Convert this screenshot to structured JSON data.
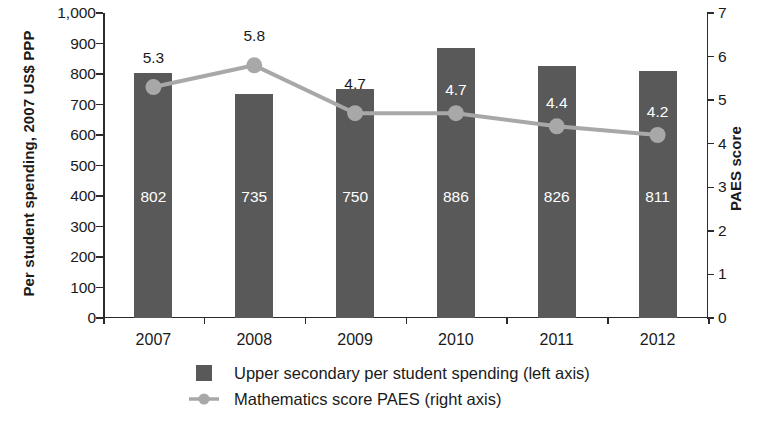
{
  "chart_data": {
    "type": "bar",
    "title": "",
    "subtitle": "",
    "categories": [
      "2007",
      "2008",
      "2009",
      "2010",
      "2011",
      "2012"
    ],
    "xlabel": "",
    "ylabel": "Per student spending, 2007 US$ PPP",
    "ylabel_right": "PAES score",
    "ylim": [
      0,
      1000
    ],
    "ylim_right": [
      0,
      7
    ],
    "yticks": [
      "0",
      "100",
      "200",
      "300",
      "400",
      "500",
      "600",
      "700",
      "800",
      "900",
      "1,000"
    ],
    "ytick_values": [
      0,
      100,
      200,
      300,
      400,
      500,
      600,
      700,
      800,
      900,
      1000
    ],
    "yticks_right": [
      "0",
      "1",
      "2",
      "3",
      "4",
      "5",
      "6",
      "7"
    ],
    "ytick_values_right": [
      0,
      1,
      2,
      3,
      4,
      5,
      6,
      7
    ],
    "grid": false,
    "legend_position": "bottom",
    "series": [
      {
        "name": "Upper secondary per student spending (left axis)",
        "type": "bar",
        "axis": "left",
        "color": "#595959",
        "values": [
          802,
          735,
          750,
          886,
          826,
          811
        ],
        "labels": [
          "802",
          "735",
          "750",
          "886",
          "826",
          "811"
        ],
        "label_color": "#ffffff"
      },
      {
        "name": "Mathematics score PAES  (right axis)",
        "type": "line",
        "axis": "right",
        "color": "#a8a8a8",
        "marker": "circle",
        "values": [
          5.3,
          5.8,
          4.7,
          4.7,
          4.4,
          4.2
        ],
        "labels": [
          "5.3",
          "5.8",
          "4.7",
          "4.7",
          "4.4",
          "4.2"
        ],
        "label_placement": [
          "above",
          "above",
          "above",
          "inside",
          "inside",
          "inside"
        ]
      }
    ]
  },
  "legend": {
    "items": [
      {
        "label": "Upper secondary per student spending (left axis)",
        "marker": "square-swatch",
        "color": "#595959"
      },
      {
        "label": "Mathematics score PAES  (right axis)",
        "marker": "line-with-circle",
        "color": "#a8a8a8"
      }
    ]
  }
}
